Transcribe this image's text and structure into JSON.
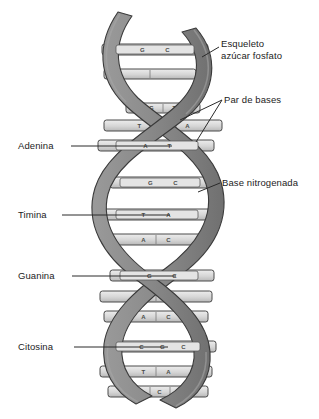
{
  "figure": {
    "background_color": "#ffffff",
    "ribbon_color": "#8a8a8a",
    "ribbon_shadow_color": "#6f6f6f",
    "rung_color": "#d8d8d8",
    "outline_color": "#3a3a3a",
    "label_color": "#1c1c1c"
  },
  "labels": {
    "esqueleto": "Esqueleto\nazúcar fosfato",
    "par_de_bases": "Par de bases",
    "base_nitrogenada": "Base nitrogenada",
    "adenina": "Adenina",
    "timina": "Timina",
    "guanina": "Guanina",
    "citosina": "Citosina"
  },
  "base_pairs": [
    {
      "index": 0,
      "y": 51,
      "left_base": "G",
      "right_base": "C",
      "text": "G  C"
    },
    {
      "index": 1,
      "y": 74,
      "left_base": "",
      "right_base": "",
      "text": ""
    },
    {
      "index": 2,
      "y": 108,
      "left_base": "G",
      "right_base": "T",
      "text": "G  T"
    },
    {
      "index": 3,
      "y": 126,
      "left_base": "T",
      "right_base": "A",
      "text": "T  C  A"
    },
    {
      "index": 4,
      "y": 146,
      "left_base": "A",
      "right_base": "T",
      "text": "A  T"
    },
    {
      "index": 5,
      "y": 183,
      "left_base": "G",
      "right_base": "C",
      "text": "G  C"
    },
    {
      "index": 6,
      "y": 215,
      "left_base": "T",
      "right_base": "A",
      "text": "T  A"
    },
    {
      "index": 7,
      "y": 240,
      "left_base": "A",
      "right_base": "C",
      "text": "A  C"
    },
    {
      "index": 8,
      "y": 276,
      "left_base": "G",
      "right_base": "C",
      "text": "G  C"
    },
    {
      "index": 9,
      "y": 297,
      "left_base": "T",
      "right_base": "A",
      "text": "T  A"
    },
    {
      "index": 10,
      "y": 317,
      "left_base": "A",
      "right_base": "C",
      "text": "A  C"
    },
    {
      "index": 11,
      "y": 347,
      "left_base": "C",
      "right_base": "G",
      "text": "C G C"
    },
    {
      "index": 12,
      "y": 372,
      "left_base": "T",
      "right_base": "A",
      "text": "T  A"
    },
    {
      "index": 13,
      "y": 391,
      "left_base": "A",
      "right_base": "C",
      "text": "A C T"
    }
  ]
}
